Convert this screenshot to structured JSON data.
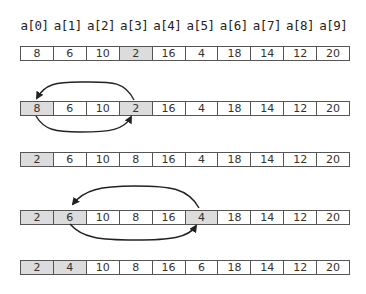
{
  "labels": [
    "a[0]",
    "a[1]",
    "a[2]",
    "a[3]",
    "a[4]",
    "a[5]",
    "a[6]",
    "a[7]",
    "a[8]",
    "a[9]"
  ],
  "rows": [
    {
      "values": [
        "8",
        "6",
        "10",
        "2",
        "16",
        "4",
        "18",
        "14",
        "12",
        "20"
      ],
      "highlighted": [
        3
      ]
    },
    {
      "values": [
        "8",
        "6",
        "10",
        "2",
        "16",
        "4",
        "18",
        "14",
        "12",
        "20"
      ],
      "highlighted": [
        0,
        3
      ],
      "swap": [
        0,
        3
      ]
    },
    {
      "values": [
        "2",
        "6",
        "10",
        "8",
        "16",
        "4",
        "18",
        "14",
        "12",
        "20"
      ],
      "highlighted": [
        0
      ]
    },
    {
      "values": [
        "2",
        "6",
        "10",
        "8",
        "16",
        "4",
        "18",
        "14",
        "12",
        "20"
      ],
      "highlighted": [
        0,
        1,
        5
      ],
      "swap": [
        1,
        5
      ]
    },
    {
      "values": [
        "2",
        "4",
        "10",
        "8",
        "16",
        "6",
        "18",
        "14",
        "12",
        "20"
      ],
      "highlighted": [
        0,
        1
      ]
    }
  ],
  "colors": {
    "highlight": "#dcdcdc",
    "border": "#555555",
    "arrow": "#222222"
  }
}
